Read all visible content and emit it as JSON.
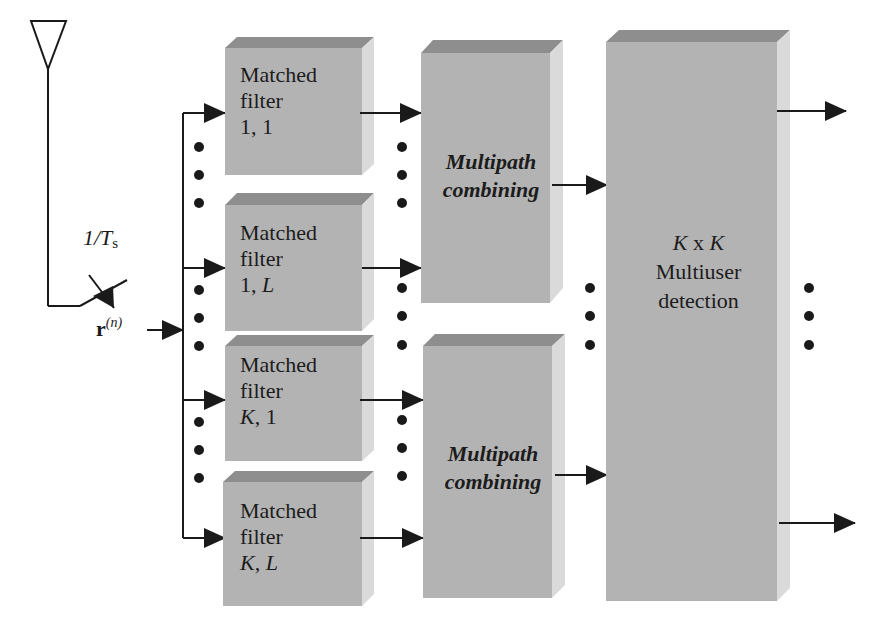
{
  "diagram": {
    "colors": {
      "box_front": "#b3b3b3",
      "box_top": "#8e8e8e",
      "box_side": "#d9d9d9",
      "line": "#1a1a1a",
      "background": "#ffffff"
    },
    "input": {
      "antenna": "antenna-icon",
      "sampler_label": "1/T",
      "sampler_sub": "s",
      "signal_label": "r",
      "signal_sup": "(n)"
    },
    "matched_filters": [
      {
        "line1": "Matched",
        "line2": "filter",
        "idx_a": "1",
        "idx_sep": ", ",
        "idx_b": "1",
        "a_italic": false,
        "b_italic": false
      },
      {
        "line1": "Matched",
        "line2": "filter",
        "idx_a": "1",
        "idx_sep": ", ",
        "idx_b": "L",
        "a_italic": false,
        "b_italic": true
      },
      {
        "line1": "Matched",
        "line2": "filter",
        "idx_a": "K",
        "idx_sep": ", ",
        "idx_b": "1",
        "a_italic": true,
        "b_italic": false
      },
      {
        "line1": "Matched",
        "line2": "filter",
        "idx_a": "K",
        "idx_sep": ", ",
        "idx_b": "L",
        "a_italic": true,
        "b_italic": true
      }
    ],
    "combiners": [
      {
        "line1": "Multipath",
        "line2": "combining"
      },
      {
        "line1": "Multipath",
        "line2": "combining"
      }
    ],
    "detector": {
      "k1": "K",
      "x": " x ",
      "k2": "K",
      "line2": "Multiuser",
      "line3": "detection"
    },
    "ellipsis": "vertical-dots"
  }
}
